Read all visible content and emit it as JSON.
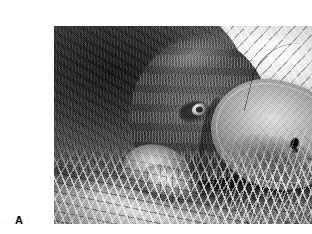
{
  "figure": {
    "panel_label": "A",
    "media_type": "photograph",
    "color_mode": "black-and-white",
    "scene": "platypus resting on grass"
  },
  "photo": {
    "frame": {
      "left_px": 14,
      "top_px": 10,
      "width_px": 283,
      "height_px": 198
    },
    "regions": [
      {
        "name": "body-fur",
        "label": "dark dense fur of body",
        "tone": "dark"
      },
      {
        "name": "head",
        "label": "head",
        "tone": "mid-grey"
      },
      {
        "name": "eye",
        "label": "eye",
        "tone": "black with white catchlight"
      },
      {
        "name": "bill",
        "label": "duck-like bill",
        "tone": "pale grey"
      },
      {
        "name": "nostril",
        "label": "nostril on bill",
        "tone": "black"
      },
      {
        "name": "forelimb",
        "label": "webbed forelimb",
        "tone": "light grey"
      },
      {
        "name": "grass-background",
        "label": "sunlit grass background",
        "tone": "bright"
      },
      {
        "name": "grass-foreground",
        "label": "grass blades in foreground",
        "tone": "bright"
      },
      {
        "name": "shadow",
        "label": "shadow beneath animal",
        "tone": "black"
      }
    ]
  },
  "colors": {
    "page_background": "#ffffff",
    "label_text": "#000000",
    "photo_highlight": "#f4f4f4",
    "photo_midtone": "#8a8a8a",
    "photo_shadow": "#141414"
  }
}
